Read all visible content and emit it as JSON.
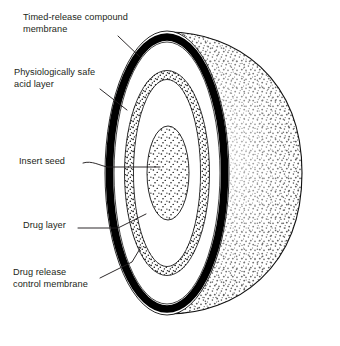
{
  "figure": {
    "background": "#ffffff",
    "ink": "#231f20",
    "labels": [
      {
        "id": "timed",
        "text": "Timed-release compound\nmembrane",
        "name": "label-timed-release-compound-membrane"
      },
      {
        "id": "acid",
        "text": "Physiologically safe\nacid layer",
        "name": "label-physiologically-safe-acid-layer"
      },
      {
        "id": "seed",
        "text": "Insert seed",
        "name": "label-insert-seed"
      },
      {
        "id": "drug",
        "text": "Drug layer",
        "name": "label-drug-layer"
      },
      {
        "id": "ctrl",
        "text": "Drug release\ncontrol membrane",
        "name": "label-drug-release-control-membrane"
      }
    ],
    "layers": [
      {
        "id": "outer-dome",
        "label": "Timed-release compound membrane",
        "fill": "stipple-dense",
        "role": "outer 3D hemisphere surface"
      },
      {
        "id": "black-ring",
        "label": "Timed-release compound membrane",
        "fill": "#000000",
        "role": "thick black outer membrane on cut face"
      },
      {
        "id": "acid-ring",
        "label": "Physiologically safe acid layer",
        "fill": "#ffffff",
        "role": "white annulus inside black membrane"
      },
      {
        "id": "drug-ring",
        "label": "Drug layer",
        "fill": "stipple-coarse",
        "role": "speckled annular band"
      },
      {
        "id": "ctrl-ring",
        "label": "Drug release control membrane",
        "fill": "#ffffff",
        "role": "white annulus inside drug layer"
      },
      {
        "id": "seed-core",
        "label": "Insert seed",
        "fill": "stipple-medium",
        "role": "central speckled oval core"
      }
    ]
  }
}
